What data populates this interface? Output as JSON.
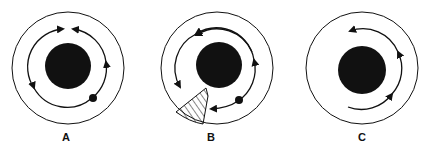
{
  "figure": {
    "panels": [
      {
        "label": "A",
        "description": "Closed circulation: two opposing flows meeting at top, small body at lower right"
      },
      {
        "label": "B",
        "description": "Circulation with hatched sector blocking lower-left, small body at lower right"
      },
      {
        "label": "C",
        "description": "Partial counter-clockwise arc flow around right side"
      }
    ]
  },
  "colors": {
    "ink": "#111111",
    "background": "#ffffff"
  }
}
